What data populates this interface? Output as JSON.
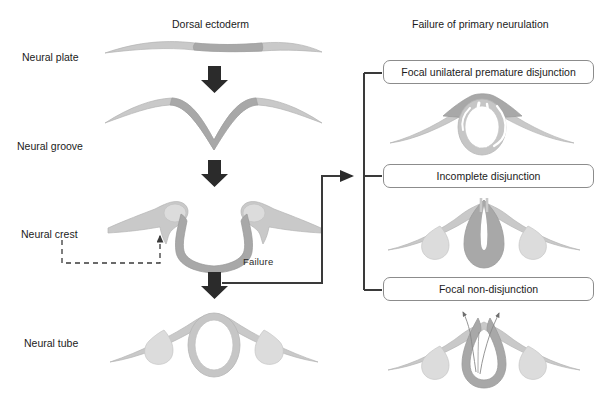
{
  "figure": {
    "type": "biological-process-diagram",
    "background_color": "#ffffff",
    "palette": {
      "surface_ectoderm": "#c9c9c9",
      "neural_ectoderm": "#a8a8a8",
      "neural_crest_fill": "#d8d8d8",
      "lumen_white": "#ffffff",
      "arrow_dark": "#2b2b2b",
      "line_dark": "#3a3a3a",
      "box_border": "#8c8c8c",
      "text": "#1b1b1b"
    }
  },
  "left_column": {
    "heading": "Dorsal ectoderm",
    "stages": [
      {
        "label": "Neural plate"
      },
      {
        "label": "Neural groove"
      },
      {
        "label": "Neural crest"
      },
      {
        "label": "Neural tube"
      }
    ],
    "down_arrows": 3,
    "failure_branch_label": "Failure"
  },
  "right_column": {
    "heading": "Failure of primary neurulation",
    "panels": [
      {
        "label": "Focal unilateral premature disjunction"
      },
      {
        "label": "Incomplete disjunction"
      },
      {
        "label": "Focal non-disjunction"
      }
    ]
  },
  "annotations": {
    "neural_crest_pointer": "dashed-leader-line",
    "non_disjunction_tract_arrows": 2
  }
}
